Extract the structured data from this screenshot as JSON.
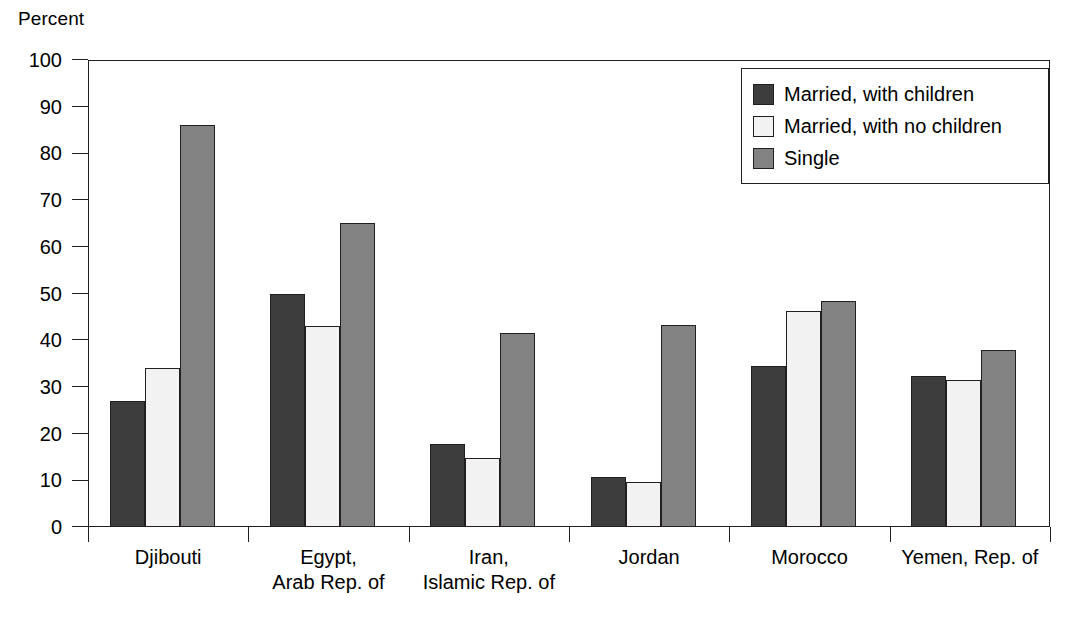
{
  "chart_data": {
    "type": "bar",
    "title": "",
    "subtitle": "",
    "xlabel": "",
    "ylabel": "Percent",
    "ylim": [
      0,
      100
    ],
    "ytick_step": 10,
    "yticks": [
      0,
      10,
      20,
      30,
      40,
      50,
      60,
      70,
      80,
      90,
      100
    ],
    "grid": false,
    "legend_position": "top-right",
    "categories": [
      "Djibouti",
      "Egypt,\nArab Rep. of",
      "Iran,\nIslamic Rep. of",
      "Jordan",
      "Morocco",
      "Yemen, Rep. of"
    ],
    "series": [
      {
        "name": "Married, with children",
        "color": "#3d3d3d",
        "values": [
          27.0,
          49.9,
          17.7,
          10.8,
          34.4,
          32.3
        ]
      },
      {
        "name": "Married, with no children",
        "color": "#f2f2f2",
        "values": [
          34.0,
          43.0,
          14.8,
          9.7,
          46.3,
          31.5
        ]
      },
      {
        "name": "Single",
        "color": "#828282",
        "values": [
          86.1,
          65.0,
          41.5,
          43.3,
          48.5,
          37.9
        ]
      }
    ]
  },
  "axis": {
    "y_title": "Percent"
  },
  "legend": {
    "items": [
      {
        "label": "Married, with children",
        "swatch": "dark-gray"
      },
      {
        "label": "Married, with no children",
        "swatch": "light-gray"
      },
      {
        "label": "Single",
        "swatch": "medium-gray"
      }
    ]
  },
  "colors": {
    "series_married_children": "#3d3d3d",
    "series_married_no_children": "#f2f2f2",
    "series_single": "#828282",
    "axis_line": "#231f20",
    "background": "#ffffff"
  }
}
